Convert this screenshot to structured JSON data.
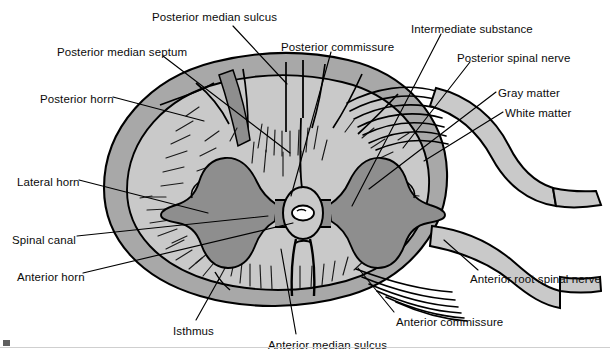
{
  "figure": {
    "colors": {
      "background": "#ffffff",
      "white_matter": "#c9c9c9",
      "gray_matter": "#8e8e8e",
      "outer_rim": "#a8a8a8",
      "nerve": "#c9c9c9",
      "outline": "#000000",
      "text": "#0b0b0b",
      "canal_lumen": "#ffffff"
    }
  },
  "labels": [
    {
      "id": "posterior-median-sulcus",
      "text": "Posterior median sulcus",
      "x": 152,
      "y": 12,
      "anchor": "start"
    },
    {
      "id": "intermediate-substance",
      "text": "Intermediate substance",
      "x": 411,
      "y": 24,
      "anchor": "start"
    },
    {
      "id": "posterior-median-septum",
      "text": "Posterior median septum",
      "x": 57,
      "y": 47,
      "anchor": "start"
    },
    {
      "id": "posterior-commissure",
      "text": "Posterior commissure",
      "x": 281,
      "y": 42,
      "anchor": "start"
    },
    {
      "id": "posterior-spinal-nerve",
      "text": "Posterior spinal nerve",
      "x": 457,
      "y": 53,
      "anchor": "start"
    },
    {
      "id": "posterior-horn",
      "text": "Posterior horn",
      "x": 40,
      "y": 94,
      "anchor": "start"
    },
    {
      "id": "gray-matter",
      "text": "Gray matter",
      "x": 498,
      "y": 88,
      "anchor": "start"
    },
    {
      "id": "white-matter",
      "text": "White matter",
      "x": 505,
      "y": 108,
      "anchor": "start"
    },
    {
      "id": "lateral-horn",
      "text": "Lateral horn",
      "x": 17,
      "y": 177,
      "anchor": "start"
    },
    {
      "id": "spinal-canal",
      "text": "Spinal canal",
      "x": 12,
      "y": 235,
      "anchor": "start"
    },
    {
      "id": "anterior-horn",
      "text": "Anterior horn",
      "x": 17,
      "y": 272,
      "anchor": "start"
    },
    {
      "id": "anterior-root-spinal-nerve",
      "text": "Anterior root spinal nerve",
      "x": 470,
      "y": 274,
      "anchor": "start"
    },
    {
      "id": "anterior-commissure",
      "text": "Anterior commissure",
      "x": 396,
      "y": 317,
      "anchor": "start"
    },
    {
      "id": "isthmus",
      "text": "Isthmus",
      "x": 173,
      "y": 326,
      "anchor": "start"
    },
    {
      "id": "anterior-median-sulcus",
      "text": "Anterior median sulcus",
      "x": 268,
      "y": 340,
      "anchor": "start"
    }
  ],
  "leader_lines": [
    {
      "id": "leader-posterior-median-sulcus",
      "points": "233,26 287,84"
    },
    {
      "id": "leader-posterior-median-septum",
      "points": "163,56 290,153"
    },
    {
      "id": "leader-posterior-horn",
      "points": "113,97 204,121"
    },
    {
      "id": "leader-posterior-commissure",
      "points": "331,52 291,196"
    },
    {
      "id": "leader-intermediate-substance",
      "points": "441,34 352,206"
    },
    {
      "id": "leader-posterior-spinal-nerve",
      "points": "470,62 403,148"
    },
    {
      "id": "leader-gray-matter",
      "points": "496,92 369,189"
    },
    {
      "id": "leader-white-matter",
      "points": "503,112 424,161"
    },
    {
      "id": "leader-lateral-horn",
      "points": "79,180 208,213"
    },
    {
      "id": "leader-spinal-canal",
      "points": "77,236 268,216"
    },
    {
      "id": "leader-anterior-horn",
      "points": "83,273 293,223"
    },
    {
      "id": "leader-anterior-root-spinal-nerve",
      "points": "478,270 444,240"
    },
    {
      "id": "leader-anterior-commissure",
      "points": "394,312 358,268"
    },
    {
      "id": "leader-isthmus",
      "points": "196,320 219,279"
    },
    {
      "id": "leader-anterior-median-sulcus",
      "points": "296,334 281,249"
    }
  ]
}
